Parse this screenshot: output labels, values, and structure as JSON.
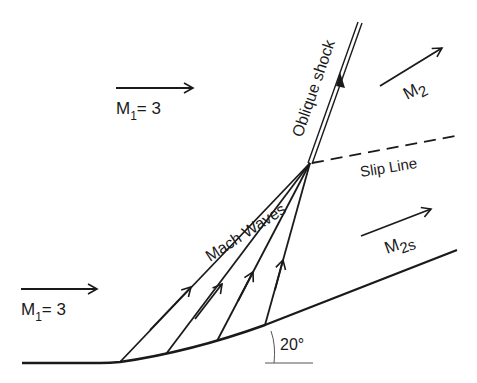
{
  "labels": {
    "upstream_mach_top": {
      "main": "M",
      "sub": "1",
      "rest": "= 3"
    },
    "upstream_mach_bottom": {
      "main": "M",
      "sub": "1",
      "rest": "= 3"
    },
    "downstream_mach_shock": {
      "main": "M",
      "sub": "2"
    },
    "downstream_mach_isentropic": {
      "main": "M",
      "sub": "2s"
    },
    "oblique_shock": "Oblique shock",
    "slip_line": "Slip Line",
    "mach_waves": "Mach Waves",
    "wall_angle": "20°"
  },
  "colors": {
    "line": "#1a1a1a",
    "thin": "#555555",
    "background": "#ffffff"
  }
}
